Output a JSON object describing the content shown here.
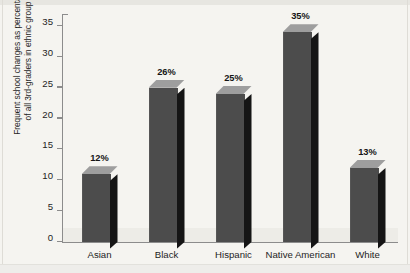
{
  "chart_data": {
    "type": "bar",
    "title": "",
    "xlabel": "",
    "ylabel_line1": "Frequent school changes as percentage",
    "ylabel_line2": "of all 3rd-graders in ethnic group",
    "categories": [
      "Asian",
      "Black",
      "Hispanic",
      "Native American",
      "White"
    ],
    "values": [
      11,
      25,
      24,
      34,
      12
    ],
    "data_labels": [
      "12%",
      "26%",
      "25%",
      "35%",
      "13%"
    ],
    "ylim": [
      0,
      35
    ],
    "yticks": [
      0,
      5,
      10,
      15,
      20,
      25,
      30,
      35
    ],
    "ytick_labels": [
      "0",
      "5",
      "10",
      "15",
      "20",
      "25",
      "30",
      "35"
    ],
    "grid": false,
    "legend": null,
    "colors": {
      "bar_front": "#4c4c4c",
      "bar_side": "#151515",
      "bar_top": "#9e9e9e",
      "axis": "#8c8c8c",
      "background": "#f5f4f0",
      "text": "#1d1d1d"
    }
  }
}
